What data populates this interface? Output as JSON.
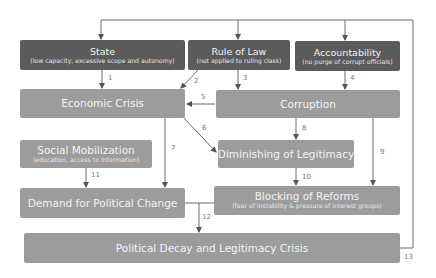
{
  "nodes": {
    "state": {
      "title": "State",
      "subtitle": "(low capacity, excessive scope and autonomy)"
    },
    "rule_of_law": {
      "title": "Rule of Law",
      "subtitle": "(not applied to ruling class)"
    },
    "accountability": {
      "title": "Accountability",
      "subtitle": "(no purge of corrupt officials)"
    },
    "economic_crisis": {
      "title": "Economic Crisis"
    },
    "corruption": {
      "title": "Corruption"
    },
    "social_mobilization": {
      "title": "Social Mobilization",
      "subtitle": "(education, access to information)"
    },
    "diminishing_legitimacy": {
      "title": "Diminishing of Legitimacy"
    },
    "demand_change": {
      "title": "Demand for Political Change"
    },
    "blocking_reforms": {
      "title": "Blocking of Reforms",
      "subtitle": "(fear of instability & pressure of interest groups)"
    },
    "political_decay": {
      "title": "Political Decay and Legitimacy Crisis"
    }
  },
  "edges": [
    {
      "id": "1",
      "label": "1",
      "from": "State",
      "to": "Economic Crisis"
    },
    {
      "id": "2",
      "label": "2",
      "from": "Rule of Law",
      "to": "Economic Crisis"
    },
    {
      "id": "3",
      "label": "3",
      "from": "Rule of Law",
      "to": "Corruption"
    },
    {
      "id": "4",
      "label": "4",
      "from": "Accountability",
      "to": "Corruption"
    },
    {
      "id": "5",
      "label": "5",
      "from": "Corruption",
      "to": "Economic Crisis"
    },
    {
      "id": "6",
      "label": "6",
      "from": "Economic Crisis",
      "to": "Diminishing of Legitimacy"
    },
    {
      "id": "7",
      "label": "7",
      "from": "Economic Crisis",
      "to": "Demand for Political Change"
    },
    {
      "id": "8",
      "label": "8",
      "from": "Corruption",
      "to": "Diminishing of Legitimacy"
    },
    {
      "id": "9",
      "label": "9",
      "from": "Corruption",
      "to": "Blocking of Reforms"
    },
    {
      "id": "10",
      "label": "10",
      "from": "Diminishing of Legitimacy",
      "to": "Blocking of Reforms"
    },
    {
      "id": "11",
      "label": "11",
      "from": "Social Mobilization",
      "to": "Demand for Political Change"
    },
    {
      "id": "12",
      "label": "12",
      "from": "Demand for Political Change + Blocking of Reforms",
      "to": "Political Decay and Legitimacy Crisis"
    },
    {
      "id": "13",
      "label": "13",
      "from": "Political Decay and Legitimacy Crisis",
      "to": "State / Rule of Law / Accountability"
    }
  ],
  "colors": {
    "dark_box": "#5b5b5b",
    "light_box": "#9c9c9c",
    "line": "#666666"
  }
}
